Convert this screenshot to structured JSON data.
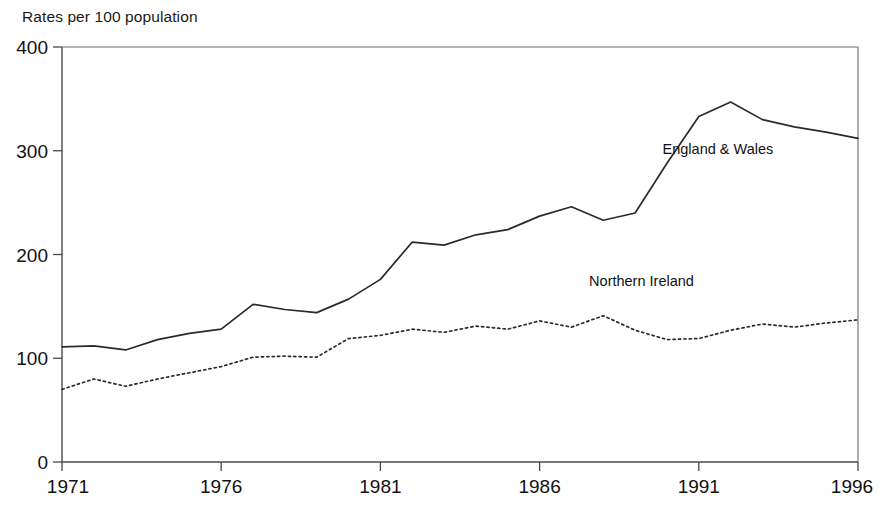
{
  "chart_data": {
    "type": "line",
    "title": "",
    "ylabel": "Rates per 100 population",
    "xlabel": "",
    "ylim": [
      0,
      400
    ],
    "xlim": [
      1971,
      1996
    ],
    "grid": false,
    "legend_position": "inline-annotation",
    "y_ticks": [
      "0",
      "100",
      "200",
      "300",
      "400"
    ],
    "y_tick_values": [
      0,
      100,
      200,
      300,
      400
    ],
    "x_ticks": [
      "1971",
      "1976",
      "1981",
      "1986",
      "1991",
      "1996"
    ],
    "x_tick_values": [
      1971,
      1976,
      1981,
      1986,
      1991,
      1996
    ],
    "x": [
      1971,
      1972,
      1973,
      1974,
      1975,
      1976,
      1977,
      1978,
      1979,
      1980,
      1981,
      1982,
      1983,
      1984,
      1985,
      1986,
      1987,
      1988,
      1989,
      1990,
      1991,
      1992,
      1993,
      1994,
      1995,
      1996
    ],
    "series": [
      {
        "name": "England & Wales",
        "style": "solid",
        "color": "#2b2b2b",
        "values": [
          111,
          112,
          108,
          118,
          124,
          128,
          152,
          147,
          144,
          157,
          176,
          212,
          209,
          219,
          224,
          237,
          246,
          233,
          240,
          288,
          333,
          347,
          330,
          323,
          318,
          312
        ]
      },
      {
        "name": "Northern Ireland",
        "style": "dotted",
        "color": "#2b2b2b",
        "values": [
          70,
          80,
          73,
          80,
          86,
          92,
          101,
          102,
          101,
          119,
          122,
          128,
          125,
          131,
          128,
          136,
          130,
          141,
          127,
          118,
          119,
          127,
          133,
          130,
          134,
          137
        ]
      }
    ],
    "annotations": [
      {
        "name": "england-wales-label",
        "text": "England & Wales",
        "x": 1991.6,
        "y": 297
      },
      {
        "name": "northern-ireland-label",
        "text": "Northern Ireland",
        "x": 1989.2,
        "y": 170
      }
    ]
  }
}
